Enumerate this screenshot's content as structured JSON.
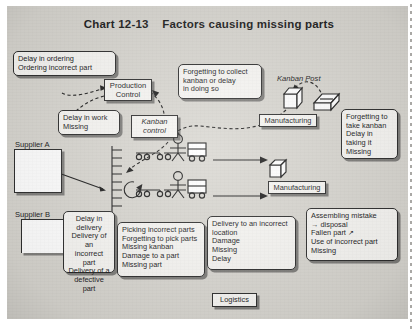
{
  "title": "Chart 12-13    Factors causing missing parts",
  "diagram": {
    "type": "process-flowchart",
    "subject": "Factors causing missing parts",
    "nodes": {
      "production_control": "Production\nControl",
      "kanban_control": "Kanban\ncontrol",
      "supplier_a": "Supplier A",
      "supplier_b": "Supplier B",
      "manufacturing_1": "Manufacturing",
      "manufacturing_2": "Manufacturing",
      "kanban_post": "Kanban Post",
      "logistics": "Logistics"
    },
    "callouts": {
      "ordering": "Delay in ordering\nOrdering incorrect part",
      "delay_in_work": "Delay in work\nMissing",
      "collect_kanban": "Forgetting to collect\nkanban or delay\nin doing so",
      "take_kanban": "Forgetting to\ntake kanban\nDelay in\ntaking it\nMissing",
      "delivery_supplier": "Delay in\ndelivery\nDelivery of an\nincorrect part\nDelivery of a\ndefective part",
      "picking": "Picking incorrect parts\nForgetting to pick parts\nMissing kanban\nDamage to a part\nMissing part",
      "delivery_location": "Delivery to an incorrect\nlocation\nDamage\nMissing\nDelay",
      "assembling": "Assembling mistake\n→ disposal\nFallen part ↗\nUse of incorrect part\nMissing"
    }
  },
  "colors": {
    "paper": "#d8d6d0",
    "ink": "#1c1c1c",
    "box_fill": "#f7f6f3",
    "white": "#ffffff"
  }
}
